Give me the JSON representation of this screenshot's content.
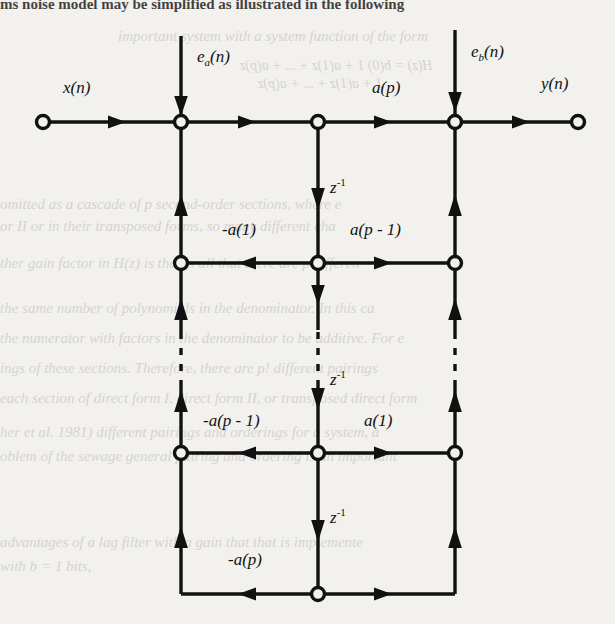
{
  "page": {
    "background_color": "#f2f1ed",
    "ink_color": "#111111",
    "bleed_text_color": "#6b6a66"
  },
  "page_text": {
    "header_line": "ms noise model may be simplified as illustrated in the following",
    "bleed_lines": [
      "important system with a system function of the form",
      "H(z) = b(0)  1 + a(1)z + ... + a(p)z",
      "1 + a(1)z   + ... + a(p)z",
      "omitted as a cascade of p second-order sections, where e",
      "or II or in their transposed forms, so many different cha",
      "ther gain factor in H(z) is that is all that there are p differen",
      "the same number of polynomials in the denominator. In this ca",
      "the numerator with factors in the denominator to be additive. For e",
      "ings of these sections. Therefore, there are p! different pairings",
      "each section of direct form I, direct form II, or transposed direct form",
      "her et al. 1981) different pairings and orderings for a system, a",
      "oblem of the sewage general pairing and ordering is an important",
      "advantages of a lag filter with a gain that that is implemente",
      "with b = 1 bits,"
    ]
  },
  "diagram": {
    "type": "signal-flow-graph",
    "nodes": {
      "input_node": "x(n)",
      "output_node": "y(n)"
    },
    "labels": {
      "input": "x(n)",
      "output": "y(n)",
      "noise_a": "e_a(n)",
      "noise_b": "e_b(n)",
      "gain_ap": "a(p)",
      "delay": "z^-1",
      "row1_left": "-a(1)",
      "row1_right": "a(p - 1)",
      "row2_left": "-a(p - 1)",
      "row2_right": "a(1)",
      "row3_left": "-a(p)"
    },
    "label_parts": {
      "noise_a": {
        "base": "e",
        "sub": "a",
        "arg": "(n)"
      },
      "noise_b": {
        "base": "e",
        "sub": "b",
        "arg": "(n)"
      },
      "delay": {
        "base": "z",
        "sup": "-1"
      },
      "gain_ap": {
        "text": "a(p)"
      },
      "row1_left": {
        "text": "-a(1)"
      },
      "row1_right": {
        "text": "a(p - 1)"
      },
      "row2_left": {
        "text": "-a(p - 1)"
      },
      "row2_right": {
        "text": "a(1)"
      },
      "row3_left": {
        "text": "-a(p)"
      }
    },
    "geometry": {
      "col_left_x": 181,
      "col_mid_x": 318,
      "col_right_x": 455,
      "row_top_y": 122,
      "row_1_y": 263,
      "row_2_y": 453,
      "row_3_y": 594,
      "input_x": 43,
      "output_x": 578
    },
    "ellipsis": "vertical dashed segments indicating repeated sections"
  }
}
